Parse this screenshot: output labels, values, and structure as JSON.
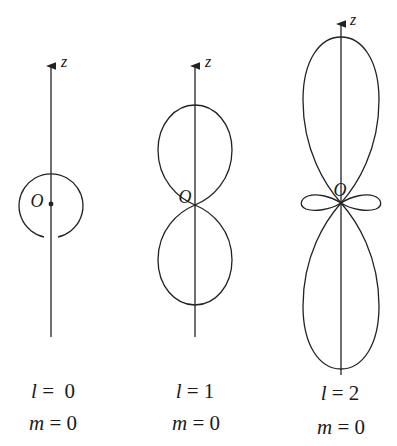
{
  "diagram": {
    "title": "",
    "panels": [
      {
        "axis_label": "z",
        "origin_label": "O",
        "l_label": "l",
        "l_value": "0",
        "m_label": "m",
        "m_value": "0",
        "shape": "sphere"
      },
      {
        "axis_label": "z",
        "origin_label": "O",
        "l_label": "l",
        "l_value": "1",
        "m_label": "m",
        "m_value": "0",
        "shape": "two-lobes"
      },
      {
        "axis_label": "z",
        "origin_label": "O",
        "l_label": "l",
        "l_value": "2",
        "m_label": "m",
        "m_value": "0",
        "shape": "two-lobes-with-torus"
      }
    ],
    "equals": "=",
    "stroke_color": "#222222"
  }
}
